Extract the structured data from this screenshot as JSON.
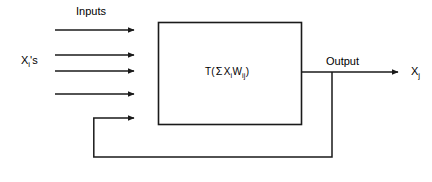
{
  "diagram": {
    "labels": {
      "inputs": "Inputs",
      "input_signals": "X",
      "input_signals_sub": "i",
      "input_signals_suffix": "'s",
      "output": "Output",
      "output_signal": "X",
      "output_signal_sub": "j"
    },
    "block": {
      "transfer_function": "T",
      "open_paren": "(",
      "summation": "Σ",
      "input_var": "X",
      "input_var_sub": "i",
      "weight_var": "W",
      "weight_var_sub": "ij",
      "close_paren": ")",
      "formula_plain": "T( Σ XiWij )"
    },
    "colors": {
      "stroke": "#1a1a1a",
      "background": "#ffffff",
      "text": "#000000"
    },
    "geometry": {
      "canvas_width": 432,
      "canvas_height": 182,
      "box": {
        "x": 158,
        "y": 22,
        "width": 144,
        "height": 103
      },
      "input_arrows_y": [
        30,
        55,
        71,
        94,
        118
      ],
      "input_arrow_start_x": 55,
      "input_arrow_end_x": 140,
      "feedback_arrow_start_x": 93,
      "feedback_bottom_y": 157,
      "feedback_tap_x": 332,
      "output_line_y": 72,
      "output_arrow_end_x": 404
    },
    "counts": {
      "input_arrows": 4,
      "feedback_arrows": 1,
      "output_arrows": 1
    }
  }
}
